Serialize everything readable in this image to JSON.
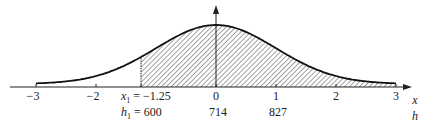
{
  "chart_data": {
    "type": "area",
    "title": "",
    "xlabel": "x",
    "secondary_xlabel": "h",
    "x_ticks": [
      -3,
      -2,
      -1.25,
      0,
      1,
      2,
      3
    ],
    "x_tick_labels": [
      "−3",
      "−2",
      "0",
      "1",
      "2",
      "3"
    ],
    "xlim": [
      -3.2,
      3.3
    ],
    "secondary_ticks": [
      {
        "x": -1.25,
        "h": 600
      },
      {
        "x": 0,
        "h": 714
      },
      {
        "x": 1,
        "h": 827
      }
    ],
    "shaded_region": {
      "from": -1.25,
      "to": 3,
      "pattern": "diagonal-hatch"
    },
    "curve": {
      "distribution": "normal",
      "mean": 0,
      "sd": 1,
      "drawn_range": [
        -3,
        3
      ]
    },
    "annotations": [
      "x1 = −1.25",
      "h1 = 600"
    ],
    "grid": false,
    "legend": null
  },
  "labels": {
    "tick_m3": "−3",
    "tick_m2": "−2",
    "tick_0": "0",
    "tick_1": "1",
    "tick_2": "2",
    "tick_3": "3",
    "x1_var": "x",
    "x1_sub": "1",
    "x1_eq": " = −1.25",
    "h1_var": "h",
    "h1_sub": "1",
    "h1_eq": " = 600",
    "h_0": "714",
    "h_1": "827",
    "axis_x": "x",
    "axis_h": "h"
  }
}
